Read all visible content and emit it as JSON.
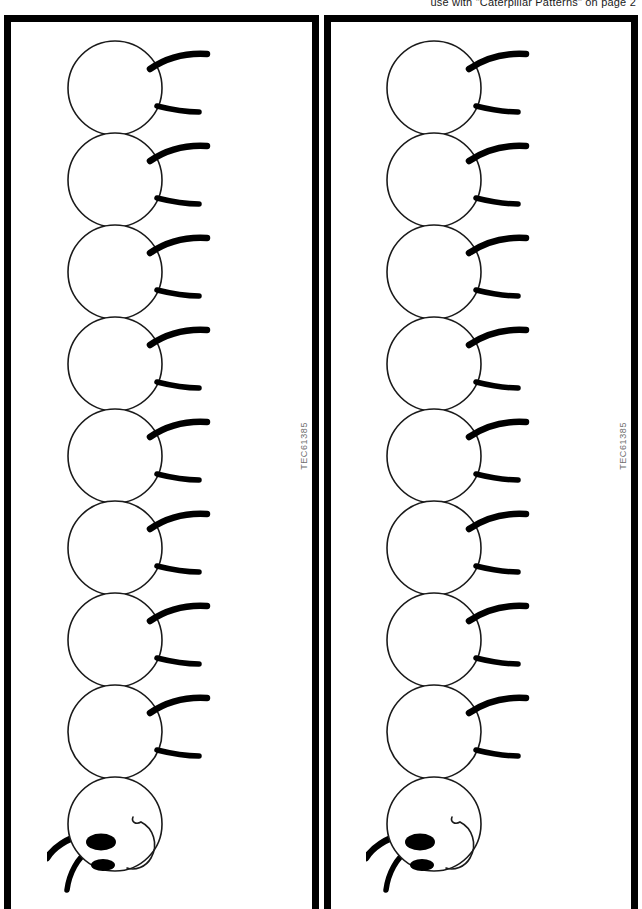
{
  "page": {
    "header_note": "use with \"Caterpillar Patterns\" on page 2",
    "background_color": "#ffffff",
    "ink_color": "#000000",
    "width": 642,
    "height": 909
  },
  "panels": [
    {
      "id": "panel-left",
      "code_label": "TEC61385",
      "caterpillar": {
        "segment_count": 8,
        "head_count": 1,
        "leg_pairs_per_segment": 2
      }
    },
    {
      "id": "panel-right",
      "code_label": "TEC61385",
      "caterpillar": {
        "segment_count": 8,
        "head_count": 1,
        "leg_pairs_per_segment": 2
      }
    }
  ],
  "icons": {
    "body_segment": "circle-outline-icon",
    "leg_upper": "curved-leg-icon",
    "leg_lower": "curved-leg-icon",
    "head": "caterpillar-head-icon",
    "eye_large": "eye-oval-icon",
    "eye_small": "eye-oval-icon",
    "cheek": "smile-curve-icon",
    "antenna": "antenna-icon"
  }
}
